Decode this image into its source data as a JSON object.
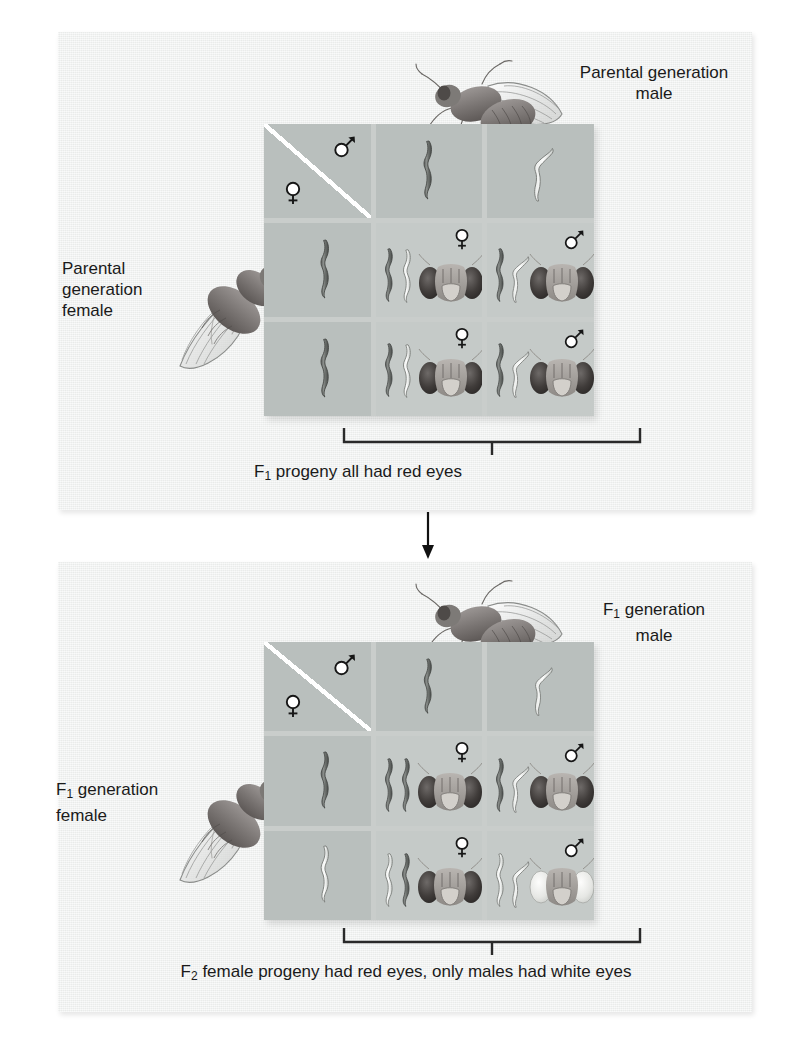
{
  "figure": {
    "background_color": "#ffffff",
    "panel_color": "#eef0ef",
    "square_color": "#c5cac8",
    "square_header_color": "#b9bfbd",
    "ink_color": "#1a1a1a"
  },
  "panels": [
    {
      "id": "parental-cross",
      "male_label": "Parental generation\nmale",
      "female_label": "Parental\ngeneration\nfemale",
      "corner": {
        "female_symbol": "female-symbol",
        "male_symbol": "male-symbol"
      },
      "gametes_male": [
        {
          "type": "X",
          "fill": "dark",
          "name": "x-chromosome"
        },
        {
          "type": "Y",
          "fill": "light",
          "name": "y-chromosome"
        }
      ],
      "gametes_female": [
        {
          "type": "X",
          "fill": "dark",
          "name": "x-chromosome"
        },
        {
          "type": "X",
          "fill": "dark",
          "name": "x-chromosome"
        }
      ],
      "offspring": [
        {
          "sex": "female",
          "sex_symbol": "female-symbol",
          "eye": "red",
          "chromosomes": [
            {
              "type": "X",
              "fill": "dark"
            },
            {
              "type": "X",
              "fill": "light"
            }
          ]
        },
        {
          "sex": "male",
          "sex_symbol": "male-symbol",
          "eye": "red",
          "chromosomes": [
            {
              "type": "X",
              "fill": "dark"
            },
            {
              "type": "Y",
              "fill": "light"
            }
          ]
        },
        {
          "sex": "female",
          "sex_symbol": "female-symbol",
          "eye": "red",
          "chromosomes": [
            {
              "type": "X",
              "fill": "dark"
            },
            {
              "type": "X",
              "fill": "light"
            }
          ]
        },
        {
          "sex": "male",
          "sex_symbol": "male-symbol",
          "eye": "red",
          "chromosomes": [
            {
              "type": "X",
              "fill": "dark"
            },
            {
              "type": "Y",
              "fill": "light"
            }
          ]
        }
      ],
      "caption_prefix": "F",
      "caption_subscript": "1",
      "caption_text": " progeny all had red eyes"
    },
    {
      "id": "f1-cross",
      "male_label": "F₁ generation\nmale",
      "female_label": "F₁ generation\nfemale",
      "corner": {
        "female_symbol": "female-symbol",
        "male_symbol": "male-symbol"
      },
      "gametes_male": [
        {
          "type": "X",
          "fill": "dark",
          "name": "x-chromosome"
        },
        {
          "type": "Y",
          "fill": "light",
          "name": "y-chromosome"
        }
      ],
      "gametes_female": [
        {
          "type": "X",
          "fill": "dark",
          "name": "x-chromosome"
        },
        {
          "type": "X",
          "fill": "light",
          "name": "x-chromosome"
        }
      ],
      "offspring": [
        {
          "sex": "female",
          "sex_symbol": "female-symbol",
          "eye": "red",
          "chromosomes": [
            {
              "type": "X",
              "fill": "dark"
            },
            {
              "type": "X",
              "fill": "dark"
            }
          ]
        },
        {
          "sex": "male",
          "sex_symbol": "male-symbol",
          "eye": "red",
          "chromosomes": [
            {
              "type": "X",
              "fill": "dark"
            },
            {
              "type": "Y",
              "fill": "light"
            }
          ]
        },
        {
          "sex": "female",
          "sex_symbol": "female-symbol",
          "eye": "red",
          "chromosomes": [
            {
              "type": "X",
              "fill": "light"
            },
            {
              "type": "X",
              "fill": "dark"
            }
          ]
        },
        {
          "sex": "male",
          "sex_symbol": "male-symbol",
          "eye": "white",
          "chromosomes": [
            {
              "type": "X",
              "fill": "light"
            },
            {
              "type": "Y",
              "fill": "light"
            }
          ]
        }
      ],
      "caption_prefix": "F",
      "caption_subscript": "2",
      "caption_text": " female progeny had red eyes, only males had white eyes"
    }
  ],
  "labels": {
    "parental_male": "Parental generation\nmale",
    "parental_female": "Parental\ngeneration\nfemale",
    "f1_male_prefix": "F",
    "f1_male_sub": "1",
    "f1_male_rest": " generation\nmale",
    "f1_female_prefix": "F",
    "f1_female_sub": "1",
    "f1_female_rest": " generation\nfemale"
  },
  "captions": {
    "f1_prefix": "F",
    "f1_sub": "1",
    "f1_rest": " progeny all had red eyes",
    "f2_prefix": "F",
    "f2_sub": "2",
    "f2_rest": " female progeny had red eyes, only males had white eyes"
  },
  "icons": {
    "female": "female-symbol",
    "male": "male-symbol",
    "flow": "down-arrow-icon"
  }
}
